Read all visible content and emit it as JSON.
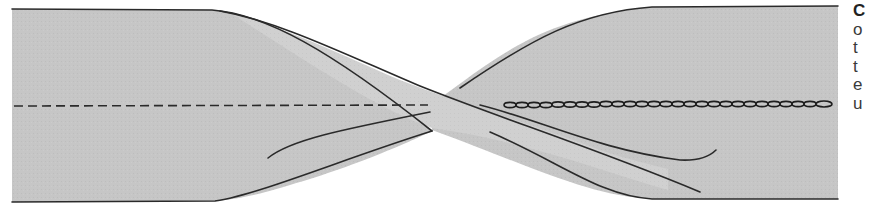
{
  "figure": {
    "colors": {
      "fill": "#c4c4c4",
      "fill_light": "#d2d2d2",
      "outline": "#2a2a2a",
      "background": "#ffffff"
    },
    "left_stitch": "dashed-line",
    "right_stitch": "chain-stitch"
  },
  "side_text": {
    "lines": [
      "C",
      "o",
      "t",
      "t",
      "e",
      "u"
    ]
  }
}
